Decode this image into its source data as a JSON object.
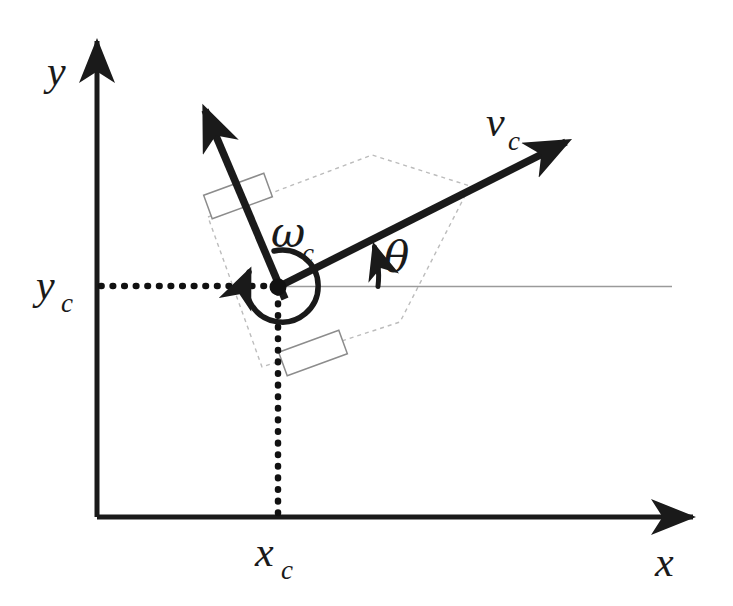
{
  "figure": {
    "kind": "robot-kinematics-diagram",
    "background_color": "#ffffff",
    "ink_color": "#1a1a1a",
    "guide_color": "#b8b8b8",
    "wheel_color": "#808080",
    "width": 733,
    "height": 606
  },
  "axes": {
    "x_label": "x",
    "y_label": "y",
    "x_axis": {
      "x1": 97,
      "y1": 517,
      "x2": 700,
      "y2": 517
    },
    "y_axis": {
      "x1": 97,
      "y1": 517,
      "x2": 97,
      "y2": 33
    },
    "x_label_pos": {
      "x": 655,
      "y": 576
    },
    "y_label_pos": {
      "x": 47,
      "y": 85
    }
  },
  "coordinate_marks": {
    "xc_label": "x",
    "xc_subscript": "c",
    "yc_label": "y",
    "yc_subscript": "c",
    "xc_label_pos": {
      "x": 257,
      "y": 570
    },
    "yc_label_pos": {
      "x": 36,
      "y": 303
    },
    "center_point": {
      "x": 278,
      "y": 287
    },
    "dotted_horizontal": {
      "x1": 100,
      "y1": 286,
      "x2": 276,
      "y2": 286
    },
    "dotted_vertical": {
      "x1": 278,
      "y1": 289,
      "x2": 278,
      "y2": 515
    }
  },
  "vectors": {
    "velocity": {
      "label": "v",
      "subscript": "c",
      "label_pos": {
        "x": 487,
        "y": 140
      },
      "tail": {
        "x": 278,
        "y": 287
      },
      "tip": {
        "x": 577,
        "y": 137
      },
      "angle_deg": 26.6
    },
    "lateral": {
      "tail": {
        "x": 284,
        "y": 297
      },
      "tip": {
        "x": 200,
        "y": 98
      }
    },
    "omega": {
      "label": "ω",
      "subscript": "c",
      "label_pos": {
        "x": 272,
        "y": 250
      },
      "arc_radius": 36,
      "arrow_tip": {
        "x": 240,
        "y": 276
      }
    },
    "theta": {
      "label": "θ",
      "label_pos": {
        "x": 386,
        "y": 271
      },
      "arc_radius": 100,
      "arrow_tip": {
        "x": 373,
        "y": 240
      }
    }
  },
  "reference_line": {
    "x1": 278,
    "y1": 286,
    "x2": 672,
    "y2": 286
  },
  "body_outline": {
    "style": "dashed",
    "points": "208,217 372,155 470,186 400,322 262,367"
  },
  "wheels": [
    {
      "name": "front-left-wheel",
      "cx": 238,
      "cy": 196,
      "w": 64,
      "h": 25,
      "rotation_deg": -20
    },
    {
      "name": "rear-right-wheel",
      "cx": 313,
      "cy": 353,
      "w": 64,
      "h": 25,
      "rotation_deg": -20
    }
  ]
}
